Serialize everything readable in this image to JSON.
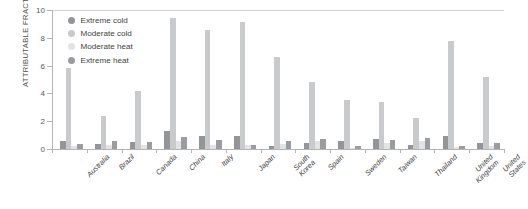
{
  "chart_data": {
    "type": "bar",
    "title": "",
    "xlabel": "",
    "ylabel": "ATTRIBUTABLE FRACTION (%)",
    "ylim": [
      0,
      10
    ],
    "yticks": [
      0,
      2,
      4,
      6,
      8,
      10
    ],
    "ytick_labels": [
      "0",
      "2",
      "4",
      "6",
      "8",
      "10"
    ],
    "grid": false,
    "legend_position": "top-left",
    "categories": [
      "Australia",
      "Brazil",
      "Canada",
      "China",
      "Italy",
      "Japan",
      "South\nKorea",
      "Spain",
      "Sweden",
      "Taiwan",
      "Thailand",
      "United\nKingdom",
      "United\nStates"
    ],
    "series": [
      {
        "name": "Extreme cold",
        "color": "#939598",
        "values": [
          0.6,
          0.35,
          0.5,
          1.3,
          0.95,
          0.95,
          0.25,
          0.4,
          0.55,
          0.75,
          0.3,
          0.95,
          0.45
        ]
      },
      {
        "name": "Moderate cold",
        "color": "#c9cacc",
        "values": [
          5.8,
          2.35,
          4.15,
          9.4,
          8.55,
          9.15,
          6.6,
          4.8,
          3.55,
          3.35,
          2.25,
          7.75,
          5.2
        ]
      },
      {
        "name": "Moderate heat",
        "color": "#e2e3e4",
        "values": [
          0.25,
          0.3,
          0.3,
          0.55,
          0.3,
          0.3,
          0.35,
          0.55,
          0.1,
          0.45,
          0.55,
          0.15,
          0.25
        ]
      },
      {
        "name": "Extreme heat",
        "color": "#9a9c9f",
        "values": [
          0.35,
          0.55,
          0.5,
          0.85,
          0.65,
          0.3,
          0.55,
          0.7,
          0.2,
          0.65,
          0.8,
          0.25,
          0.45
        ]
      }
    ]
  },
  "legend": {
    "items": [
      {
        "label": "Extreme cold",
        "color": "#939598"
      },
      {
        "label": "Moderate cold",
        "color": "#c9cacc"
      },
      {
        "label": "Moderate heat",
        "color": "#e2e3e4"
      },
      {
        "label": "Extreme heat",
        "color": "#9a9c9f"
      }
    ]
  }
}
